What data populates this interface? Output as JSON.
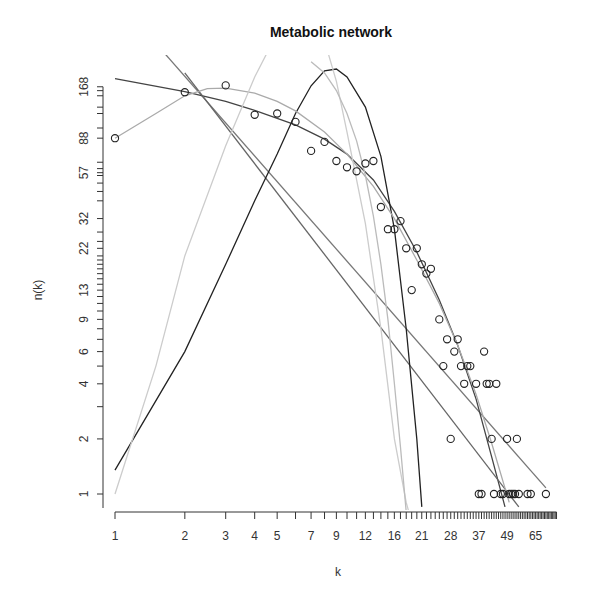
{
  "chart_data": {
    "type": "scatter",
    "title": "Metabolic network",
    "xlabel": "k",
    "ylabel": "n(k)",
    "xscale": "log",
    "yscale": "log",
    "xlim": [
      1,
      80
    ],
    "ylim": [
      1,
      168
    ],
    "grid": false,
    "legend": null,
    "x_tick_labels": [
      "1",
      "2",
      "3",
      "4",
      "5",
      "7",
      "9",
      "12",
      "16",
      "21",
      "28",
      "37",
      "49",
      "65"
    ],
    "y_tick_labels": [
      "1",
      "2",
      "4",
      "6",
      "9",
      "13",
      "22",
      "32",
      "57",
      "88",
      "168"
    ],
    "y_minor_ticks": [
      3,
      5,
      7,
      8,
      10,
      11,
      12,
      14,
      15,
      16,
      17,
      18,
      19,
      20,
      24,
      27,
      40,
      45,
      50,
      55,
      60,
      65,
      100,
      120,
      130,
      150,
      160
    ],
    "points": [
      [
        1,
        88
      ],
      [
        2,
        157
      ],
      [
        3,
        171
      ],
      [
        4,
        118
      ],
      [
        5,
        120
      ],
      [
        6,
        108
      ],
      [
        7,
        75
      ],
      [
        8,
        84
      ],
      [
        9,
        66
      ],
      [
        10,
        61
      ],
      [
        11,
        58
      ],
      [
        12,
        64
      ],
      [
        13,
        66
      ],
      [
        14,
        37
      ],
      [
        15,
        28
      ],
      [
        16,
        28
      ],
      [
        17,
        31
      ],
      [
        18,
        22
      ],
      [
        19,
        13
      ],
      [
        20,
        22
      ],
      [
        21,
        18
      ],
      [
        22,
        16
      ],
      [
        23,
        17
      ],
      [
        25,
        9
      ],
      [
        26,
        5
      ],
      [
        27,
        7
      ],
      [
        28,
        2
      ],
      [
        29,
        6
      ],
      [
        30,
        7
      ],
      [
        31,
        5
      ],
      [
        32,
        4
      ],
      [
        33,
        5
      ],
      [
        34,
        5
      ],
      [
        36,
        4
      ],
      [
        37,
        1
      ],
      [
        38,
        1
      ],
      [
        39,
        6
      ],
      [
        40,
        4
      ],
      [
        41,
        4
      ],
      [
        42,
        2
      ],
      [
        43,
        1
      ],
      [
        44,
        4
      ],
      [
        46,
        1
      ],
      [
        47,
        1
      ],
      [
        49,
        2
      ],
      [
        50,
        1
      ],
      [
        51,
        1
      ],
      [
        52,
        1
      ],
      [
        53,
        1
      ],
      [
        54,
        2
      ],
      [
        55,
        1
      ],
      [
        60,
        1
      ],
      [
        62,
        1
      ],
      [
        72,
        1
      ]
    ],
    "series": [
      {
        "name": "power-law fit",
        "color": "#777777",
        "x": [
          1.5,
          72
        ],
        "y": [
          290,
          1.08
        ]
      },
      {
        "name": "exponential-like decay (dark)",
        "color": "#444444",
        "x": [
          1,
          2,
          3,
          4,
          6,
          8,
          10,
          13,
          16,
          20,
          25,
          30,
          36,
          42,
          48
        ],
        "y": [
          186,
          158,
          140,
          125,
          104,
          87,
          72,
          52,
          35,
          21,
          11.5,
          6.5,
          3.3,
          1.6,
          0.85
        ]
      },
      {
        "name": "steep linear (mid gray)",
        "color": "#666666",
        "x": [
          2,
          55
        ],
        "y": [
          200,
          0.85
        ]
      },
      {
        "name": "poisson-like (black)",
        "color": "#222222",
        "x": [
          1,
          2,
          3,
          4,
          5,
          6,
          7,
          8,
          9,
          10,
          12,
          14,
          16,
          18,
          20,
          21
        ],
        "y": [
          1.35,
          6,
          18,
          40,
          72,
          120,
          170,
          205,
          210,
          190,
          130,
          70,
          28,
          8,
          2,
          0.85
        ]
      },
      {
        "name": "fitted curve (light gray)",
        "color": "#aaaaaa",
        "x": [
          1,
          1.5,
          2,
          2.5,
          3,
          4,
          5,
          6,
          8,
          10,
          13,
          16,
          20,
          25,
          30,
          36,
          42,
          50
        ],
        "y": [
          88,
          120,
          150,
          164,
          165,
          155,
          140,
          124,
          95,
          72,
          48,
          32,
          19,
          11,
          6.5,
          3.5,
          1.9,
          0.9
        ]
      },
      {
        "name": "gaussian-like (very light)",
        "color": "#cccccc",
        "x": [
          1,
          1.5,
          2,
          3,
          4,
          5,
          6,
          7,
          8,
          9,
          10,
          12,
          14,
          16,
          18,
          19
        ],
        "y": [
          1.0,
          5,
          20,
          80,
          190,
          330,
          450,
          420,
          300,
          180,
          95,
          30,
          8,
          2,
          0.9,
          0.7
        ]
      },
      {
        "name": "late gaussian (light)",
        "color": "#bbbbbb",
        "x": [
          7,
          8,
          9,
          10,
          11,
          12,
          13,
          14,
          15,
          16,
          17,
          18
        ],
        "y": [
          230,
          200,
          160,
          120,
          85,
          55,
          33,
          18,
          9,
          4,
          1.8,
          0.8
        ]
      }
    ]
  },
  "axis_calibration": {
    "x_px_at_1": 115,
    "x_px_per_decade": 232,
    "y_px_at_1": 494,
    "y_px_per_decade": 183
  }
}
